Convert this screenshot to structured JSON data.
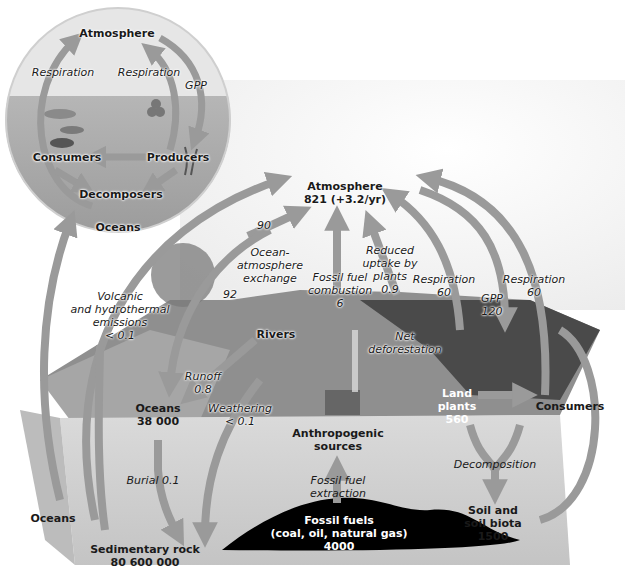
{
  "inset": {
    "reservoirs": {
      "atmosphere": "Atmosphere",
      "consumers": "Consumers",
      "producers": "Producers",
      "decomposers": "Decomposers",
      "oceans": "Oceans"
    },
    "fluxes": {
      "respiration_left": "Respiration",
      "respiration_right": "Respiration",
      "gpp": "GPP"
    }
  },
  "main": {
    "atmosphere": {
      "name": "Atmosphere",
      "value": "821 (+3.2/yr)"
    },
    "oceans": {
      "name": "Oceans",
      "value": "38 000"
    },
    "sedimentary_rock": {
      "name": "Sedimentary rock",
      "value": "80 600 000"
    },
    "fossil_fuels": {
      "name": "Fossil fuels",
      "detail": "(coal, oil, natural gas)",
      "value": "4000"
    },
    "land_plants": {
      "line1": "Land",
      "line2": "plants",
      "value": "560"
    },
    "soil": {
      "line1": "Soil and",
      "line2": "soil biota",
      "value": "1500"
    },
    "consumers": "Consumers",
    "anthropogenic": {
      "line1": "Anthropogenic",
      "line2": "sources"
    },
    "rivers": "Rivers",
    "oceans_side": "Oceans"
  },
  "fluxes": {
    "ocean_to_atm_value": "90",
    "ocean_atm_exchange": {
      "line1": "Ocean-",
      "line2": "atmosphere",
      "line3": "exchange"
    },
    "atm_to_ocean_value": "92",
    "fossil_combustion": {
      "line1": "Fossil fuel",
      "line2": "combustion",
      "value": "6"
    },
    "reduced_uptake": {
      "line1": "Reduced",
      "line2": "uptake by",
      "line3": "plants",
      "value": "0.9"
    },
    "net_deforestation": {
      "line1": "Net",
      "line2": "deforestation"
    },
    "respiration_plants": {
      "label": "Respiration",
      "value": "60"
    },
    "gpp": {
      "label": "GPP",
      "value": "120"
    },
    "respiration_consumers": {
      "label": "Respiration",
      "value": "60"
    },
    "volcanic": {
      "line1": "Volcanic",
      "line2": "and hydrothermal",
      "line3": "emissions",
      "value": "< 0.1"
    },
    "runoff": {
      "label": "Runoff",
      "value": "0.8"
    },
    "weathering": {
      "label": "Weathering",
      "value": "< 0.1"
    },
    "burial": "Burial 0.1",
    "fossil_extraction": {
      "line1": "Fossil fuel",
      "line2": "extraction"
    },
    "decomposition": "Decomposition"
  },
  "colors": {
    "arrow": "#9a9a9a",
    "arrow_dark": "#7d7d7d",
    "ocean": "#a9a9a9",
    "ground": "#8c8c8c",
    "block_front": "#d4d4d4",
    "fossil": "#000000"
  }
}
